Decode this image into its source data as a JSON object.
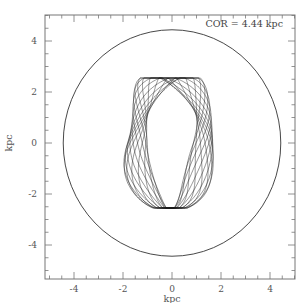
{
  "chart_data": {
    "type": "line",
    "title": "",
    "xlabel": "kpc",
    "ylabel": "kpc",
    "xlim": [
      -5.2,
      5.0
    ],
    "ylim": [
      -5.2,
      5.0
    ],
    "xticks": [
      -4,
      -2,
      0,
      2,
      4
    ],
    "yticks": [
      -4,
      -2,
      0,
      2,
      4
    ],
    "xtick_labels": [
      "-4",
      "-2",
      "0",
      "2",
      "4"
    ],
    "ytick_labels": [
      "-4",
      "-2",
      "0",
      "2",
      "4"
    ],
    "minor_tick_step": 0.5,
    "grid": false,
    "legend": null,
    "annotation": "COR = 4.44 kpc",
    "series": [
      {
        "name": "corotation circle",
        "shape": "circle",
        "center": [
          0,
          0
        ],
        "radius": 4.44
      },
      {
        "name": "stellar orbit",
        "shape": "box orbit (diamond-shaped, many overlapping loops)",
        "x_extent": [
          -1.9,
          1.75
        ],
        "y_extent": [
          -2.55,
          2.55
        ],
        "inner_hole_vertices": [
          [
            0,
            1.6
          ],
          [
            1.1,
            0
          ],
          [
            0,
            -1.5
          ],
          [
            -1.1,
            0
          ]
        ]
      }
    ]
  },
  "plot": {
    "frame": {
      "left": 45,
      "top": 15,
      "right": 295,
      "bottom": 279
    },
    "x0_px": 172,
    "y0_px": 143,
    "px_per_kpc_x": 24.5,
    "px_per_kpc_y": 25.5,
    "line_color": "#222222",
    "orbit_color": "#1a1a1a"
  }
}
